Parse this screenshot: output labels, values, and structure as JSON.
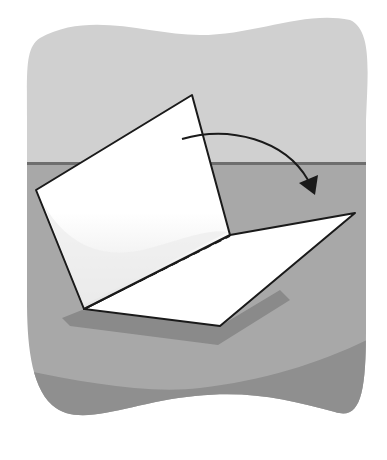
{
  "illustration": {
    "subject": "paper folded in half illustration",
    "colors": {
      "background": "#ffffff",
      "wall": "#d0d0d0",
      "horizon_line": "#6e6e6e",
      "floor": "#a8a8a8",
      "floor_front": "#8e8e8e",
      "shadow": "#8a8a8a",
      "paper": "#ffffff",
      "paper_shade": "#e6e6e6",
      "outline": "#1a1a1a"
    }
  }
}
